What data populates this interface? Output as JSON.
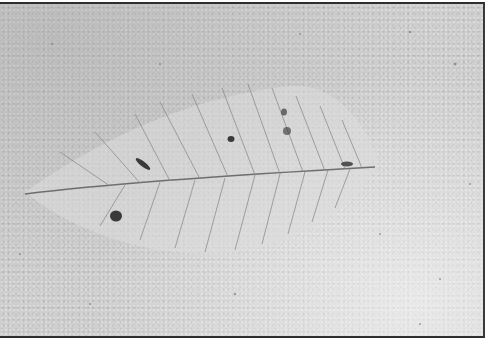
{
  "image": {
    "description": "Grayscale photograph of a fossil leaf impression on a speckled stone surface",
    "subject": "leaf",
    "palette": {
      "background": "#cfcfcf",
      "leaf_fill": "#dcdcdc",
      "vein": "#8a8a8a",
      "midrib": "#6e6e6e",
      "spot": "#3a3a3a",
      "frame": "#2e2e2e"
    },
    "midrib": {
      "start": [
        25,
        190
      ],
      "end": [
        375,
        163
      ]
    },
    "secondary_veins_count": 11,
    "dark_spots": [
      {
        "x": 143,
        "y": 160,
        "shape": "elongated"
      },
      {
        "x": 116,
        "y": 212,
        "shape": "round"
      },
      {
        "x": 231,
        "y": 135,
        "shape": "round"
      },
      {
        "x": 284,
        "y": 108,
        "shape": "round"
      },
      {
        "x": 287,
        "y": 127,
        "shape": "round"
      },
      {
        "x": 347,
        "y": 160,
        "shape": "elongated"
      }
    ]
  },
  "caption": {
    "text": ""
  }
}
